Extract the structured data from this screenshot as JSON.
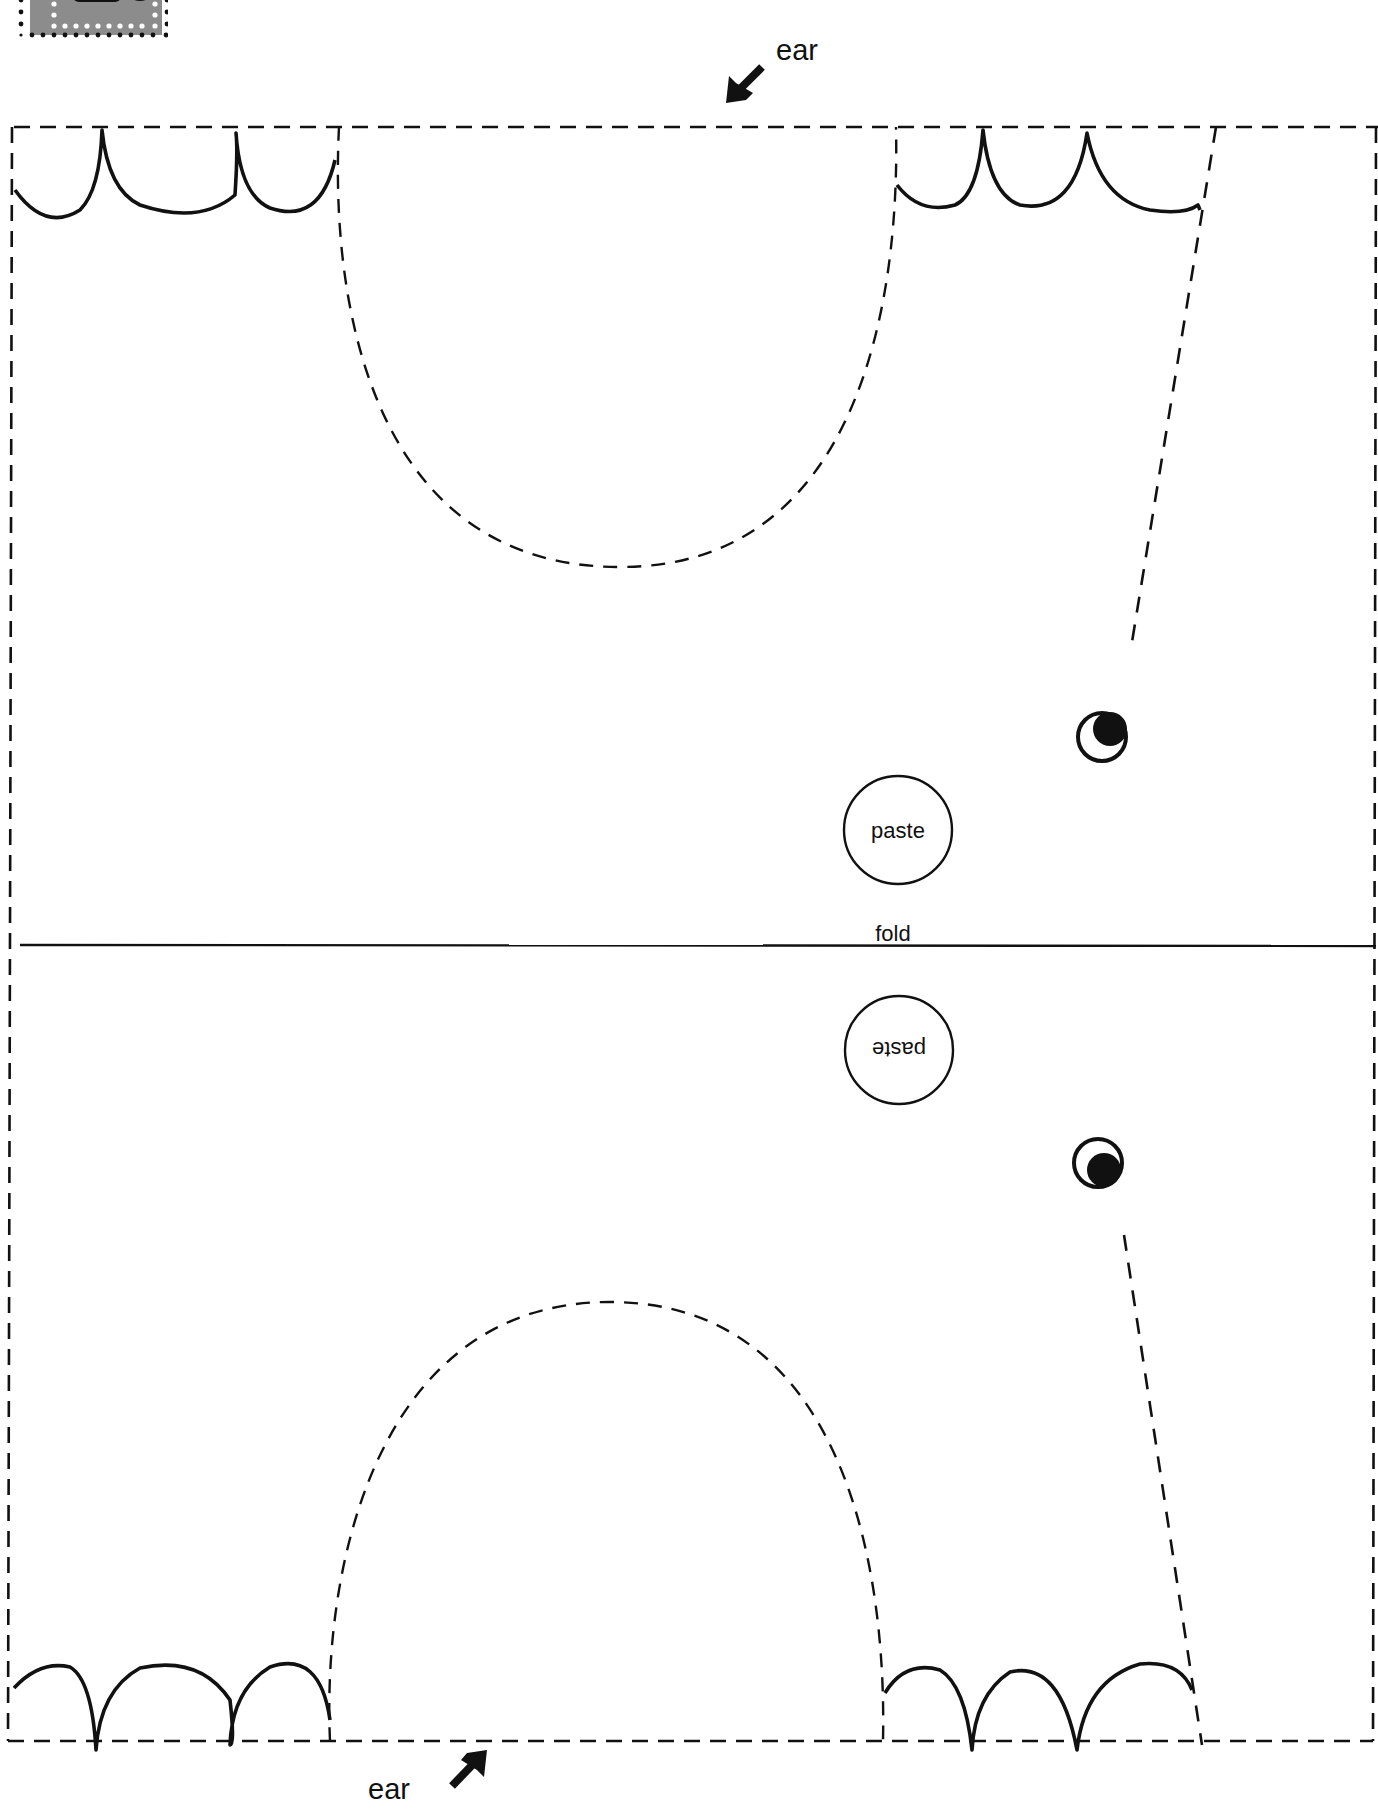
{
  "page": {
    "type": "printable cut-out template",
    "background": "#ffffff",
    "ink": "#111111"
  },
  "labels": {
    "ear_top": "ear",
    "ear_bottom": "ear",
    "fold": "fold",
    "paste_top": "paste",
    "paste_bottom": "paste"
  },
  "badge": {
    "fill": "#8c8c8c",
    "dot_color": "#ffffff",
    "border_dot_color": "#111111"
  },
  "icons": {
    "ear_arrow_top": "arrow-down-left",
    "ear_arrow_bottom": "arrow-up-right",
    "eye_top": "eye",
    "eye_bottom": "eye"
  }
}
